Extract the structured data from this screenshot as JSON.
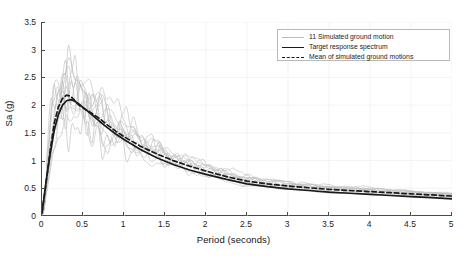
{
  "chart_data": {
    "type": "line",
    "title": "",
    "xlabel": "Period (seconds)",
    "ylabel": "Sa (g)",
    "xlim": [
      0,
      5
    ],
    "ylim": [
      0,
      3.5
    ],
    "xticks": [
      0,
      0.5,
      1,
      1.5,
      2,
      2.5,
      3,
      3.5,
      4,
      4.5,
      5
    ],
    "xtick_labels": [
      "0",
      "0.5",
      "1",
      "1.5",
      "2",
      "2.5",
      "3",
      "3.5",
      "4",
      "4.5",
      "5"
    ],
    "yticks": [
      0,
      0.5,
      1,
      1.5,
      2,
      2.5,
      3,
      3.5
    ],
    "ytick_labels": [
      "0",
      "0.5",
      "1",
      "1.5",
      "2",
      "2.5",
      "3",
      "3.5"
    ],
    "grid": true,
    "grid_color": "#f0f0f0",
    "legend_position": "top-right",
    "legend": [
      {
        "label": "11 Simulated ground motion",
        "style": "thin-solid",
        "color": "#bcbcbc"
      },
      {
        "label": "Target response spectrum",
        "style": "solid",
        "color": "#1a1a1a"
      },
      {
        "label": "Mean of simulated ground motions",
        "style": "dashed",
        "color": "#1a1a1a"
      }
    ],
    "x": [
      0,
      0.05,
      0.1,
      0.15,
      0.2,
      0.25,
      0.3,
      0.35,
      0.4,
      0.45,
      0.5,
      0.6,
      0.7,
      0.8,
      0.9,
      1.0,
      1.2,
      1.4,
      1.6,
      1.8,
      2.0,
      2.25,
      2.5,
      2.75,
      3.0,
      3.25,
      3.5,
      3.75,
      4.0,
      4.25,
      4.5,
      4.75,
      5.0
    ],
    "series": [
      {
        "name": "Target response spectrum",
        "style": "solid",
        "color": "#1a1a1a",
        "width": 1.7,
        "values": [
          0.05,
          0.62,
          1.12,
          1.55,
          1.83,
          2.0,
          2.08,
          2.1,
          2.07,
          2.02,
          1.96,
          1.84,
          1.71,
          1.59,
          1.48,
          1.38,
          1.2,
          1.05,
          0.93,
          0.83,
          0.75,
          0.66,
          0.58,
          0.53,
          0.49,
          0.46,
          0.43,
          0.41,
          0.39,
          0.37,
          0.35,
          0.33,
          0.31
        ]
      },
      {
        "name": "Mean of simulated ground motions",
        "style": "dashed",
        "color": "#1a1a1a",
        "width": 1.7,
        "values": [
          0.06,
          0.6,
          1.18,
          1.68,
          1.97,
          2.12,
          2.18,
          2.16,
          2.08,
          2.0,
          1.95,
          1.86,
          1.76,
          1.64,
          1.53,
          1.43,
          1.26,
          1.12,
          1.0,
          0.9,
          0.81,
          0.71,
          0.63,
          0.58,
          0.54,
          0.51,
          0.48,
          0.46,
          0.44,
          0.42,
          0.4,
          0.38,
          0.36
        ]
      }
    ],
    "simulated_count": 11,
    "simulated_color": "#bcbcbc",
    "simulated_note": "11 individual jagged simulated ground motion spectra, peaking between roughly 2.2 and 3.1 g near 0.2-0.6 s and converging to about 0.25-0.45 g at 5 s"
  },
  "axis": {
    "xlabel": "Period (seconds)",
    "ylabel": "Sa (g)"
  }
}
